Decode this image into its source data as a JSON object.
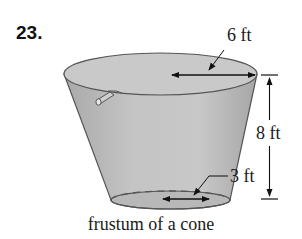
{
  "problem": {
    "number": "23."
  },
  "figure": {
    "shape": "frustum of a cone",
    "fill_color": "#bdbdbd",
    "stroke_color": "#555555",
    "labels": {
      "top_radius": "6 ft",
      "height": "8 ft",
      "bottom_radius": "3 ft"
    },
    "caption": "frustum of a cone"
  }
}
